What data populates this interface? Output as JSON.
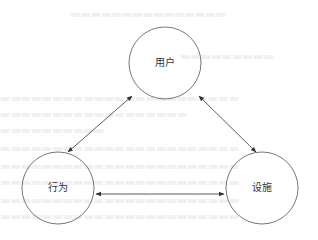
{
  "diagram": {
    "type": "relationship-triangle",
    "stroke_color": "#777777",
    "arrow_color": "#333333",
    "label_color": "#333333",
    "nodes": [
      {
        "id": "user",
        "label": "用户",
        "cx": 165,
        "cy": 63,
        "r": 36
      },
      {
        "id": "behavior",
        "label": "行为",
        "cx": 58,
        "cy": 188,
        "r": 36
      },
      {
        "id": "facility",
        "label": "设施",
        "cx": 262,
        "cy": 188,
        "r": 36
      }
    ],
    "edges": [
      {
        "from": "user",
        "to": "behavior",
        "direction": "bidirectional",
        "x1": 132,
        "y1": 96,
        "x2": 68,
        "y2": 152
      },
      {
        "from": "user",
        "to": "facility",
        "direction": "bidirectional",
        "x1": 199,
        "y1": 96,
        "x2": 256,
        "y2": 152
      },
      {
        "from": "behavior",
        "to": "facility",
        "direction": "bidirectional",
        "x1": 96,
        "y1": 194,
        "x2": 224,
        "y2": 194
      }
    ]
  }
}
